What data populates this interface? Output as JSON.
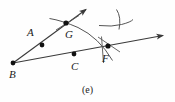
{
  "figure": {
    "caption": "(e)",
    "background_color": "#fefefe",
    "ink_color": "#3a3a3a",
    "label_color": "#1b1b1b",
    "width": 175,
    "height": 102
  },
  "points": [
    {
      "id": "A",
      "label": "A",
      "x": 42,
      "y": 45,
      "label_x": 27,
      "label_y": 27
    },
    {
      "id": "B",
      "label": "B",
      "x": 13,
      "y": 63,
      "label_x": 9,
      "label_y": 69
    },
    {
      "id": "C",
      "label": "C",
      "x": 74,
      "y": 54,
      "label_x": 71,
      "label_y": 61
    },
    {
      "id": "F",
      "label": "F",
      "x": 108,
      "y": 46,
      "label_x": 102,
      "label_y": 53
    },
    {
      "id": "G",
      "label": "G",
      "x": 66,
      "y": 23,
      "label_x": 65,
      "label_y": 29
    }
  ],
  "rays": [
    {
      "id": "ray-BG",
      "from": "B",
      "through": "G",
      "x1": 13,
      "y1": 63,
      "x2": 88,
      "y2": 8,
      "arrow": "end"
    },
    {
      "id": "ray-BF",
      "from": "B",
      "through": "F",
      "x1": 13,
      "y1": 63,
      "x2": 166,
      "y2": 35,
      "arrow": "end"
    }
  ],
  "arcs": [
    {
      "id": "arc-GF",
      "description": "arc crossing ray BG at G and ray BF at F"
    },
    {
      "id": "arc-tick-right",
      "description": "small arc with tick mark at upper right"
    }
  ],
  "tick_marks": [
    {
      "id": "tick-G",
      "on": "arc-GF",
      "at": "G"
    },
    {
      "id": "tick-F",
      "on": "arc-GF",
      "at": "F"
    },
    {
      "id": "tick-right",
      "on": "arc-tick-right"
    }
  ]
}
